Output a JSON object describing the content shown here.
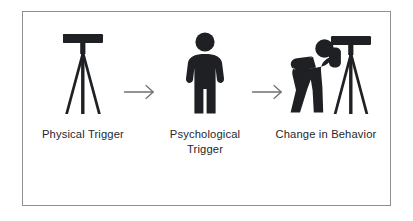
{
  "diagram": {
    "type": "process-flow",
    "frame": {
      "border_color": "#8d8f93",
      "background_color": "#ffffff"
    },
    "ink_color": "#1f2023",
    "text_color": "#26272b",
    "arrow_color": "#6e7074",
    "stages": [
      {
        "id": "physical-trigger",
        "label": "Physical Trigger",
        "icon": "telescope-on-tripod-icon"
      },
      {
        "id": "psychological-trigger",
        "label": "Psychological\nTrigger",
        "icon": "standing-person-icon"
      },
      {
        "id": "change-in-behavior",
        "label": "Change in Behavior",
        "icon": "person-looking-through-telescope-icon"
      }
    ],
    "connectors": [
      {
        "id": "arrow-1",
        "icon": "arrow-right-icon",
        "from": "physical-trigger",
        "to": "psychological-trigger"
      },
      {
        "id": "arrow-2",
        "icon": "arrow-right-icon",
        "from": "psychological-trigger",
        "to": "change-in-behavior"
      }
    ]
  }
}
